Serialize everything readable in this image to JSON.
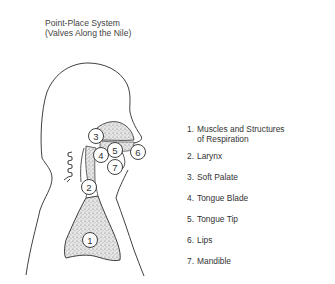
{
  "title": {
    "line1": "Point-Place System",
    "line2": "(Valves Along the Nile)"
  },
  "diagram": {
    "markers": [
      {
        "n": "1",
        "label": "Muscles and Structures of Respiration"
      },
      {
        "n": "2",
        "label": "Larynx"
      },
      {
        "n": "3",
        "label": "Soft Palate"
      },
      {
        "n": "4",
        "label": "Tongue Blade"
      },
      {
        "n": "5",
        "label": "Tongue Tip"
      },
      {
        "n": "6",
        "label": "Lips"
      },
      {
        "n": "7",
        "label": "Mandible"
      }
    ],
    "colors": {
      "line": "#2b2b2b",
      "stipple": "#b8b8b8",
      "text": "#333333"
    }
  },
  "legend": {
    "items": [
      {
        "num": "1.",
        "text": "Muscles and Structures",
        "text2": "of Respiration"
      },
      {
        "num": "2.",
        "text": "Larynx"
      },
      {
        "num": "3.",
        "text": "Soft Palate"
      },
      {
        "num": "4.",
        "text": "Tongue Blade"
      },
      {
        "num": "5.",
        "text": "Tongue Tip"
      },
      {
        "num": "6.",
        "text": "Lips"
      },
      {
        "num": "7.",
        "text": "Mandible"
      }
    ]
  }
}
